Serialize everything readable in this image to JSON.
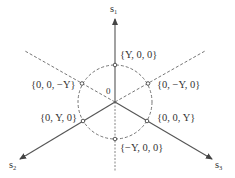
{
  "diagram": {
    "type": "deviatoric-plane-projection",
    "origin_label": "0",
    "axes": [
      {
        "name": "s",
        "subscript": "1",
        "direction": "up"
      },
      {
        "name": "s",
        "subscript": "2",
        "direction": "lower-left"
      },
      {
        "name": "s",
        "subscript": "3",
        "direction": "lower-right"
      }
    ],
    "points": [
      {
        "label": "{Y, 0, 0}",
        "position": "top"
      },
      {
        "label": "{0, −Y, 0}",
        "position": "upper-right"
      },
      {
        "label": "{0, 0, −Y}",
        "position": "upper-left"
      },
      {
        "label": "{0, Y, 0}",
        "position": "lower-left"
      },
      {
        "label": "{0, 0, Y}",
        "position": "lower-right"
      },
      {
        "label": "{−Y, 0, 0}",
        "position": "bottom"
      }
    ],
    "circle": {
      "style": "dashed"
    },
    "colors": {
      "line": "#555555",
      "text": "#333333"
    }
  }
}
